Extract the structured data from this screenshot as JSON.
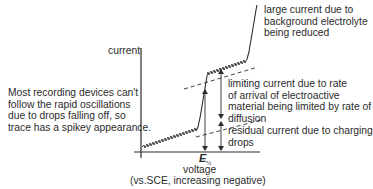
{
  "diagram": {
    "y_axis_label": "current",
    "x_axis_label_line1": "voltage",
    "x_axis_label_line2": "(vs.SCE, increasing negative)",
    "half_wave_potential": {
      "symbol": "E",
      "subscript": "½"
    },
    "annotations": {
      "background": [
        "large current due to",
        "background electrolyte",
        "being reduced"
      ],
      "limiting": [
        "limiting current due to rate",
        "of arrival of electroactive",
        "material being limited by rate of",
        "diffusion"
      ],
      "residual": [
        "residual current due to charging",
        "drops"
      ],
      "spikey_note": [
        "Most recording devices can't",
        "follow the rapid oscillations",
        "due to drops falling off, so",
        "trace has a spikey appearance."
      ]
    },
    "colors": {
      "line": "#2b2b2b",
      "background": "#ffffff"
    }
  }
}
